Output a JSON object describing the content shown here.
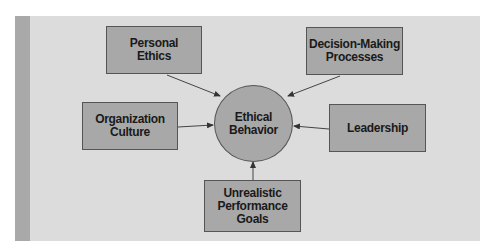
{
  "diagram": {
    "center": {
      "label": "Ethical\nBehavior"
    },
    "factors": [
      {
        "id": "personal-ethics",
        "label": "Personal\nEthics"
      },
      {
        "id": "decision-making-processes",
        "label": "Decision-Making\nProcesses"
      },
      {
        "id": "organization-culture",
        "label": "Organization\nCulture"
      },
      {
        "id": "leadership",
        "label": "Leadership"
      },
      {
        "id": "unrealistic-performance-goals",
        "label": "Unrealistic\nPerformance\nGoals"
      }
    ],
    "colors": {
      "panel": "#dcdcdc",
      "stripe": "#a9a9a9",
      "node_fill": "#a8a8a8",
      "node_border": "#555555",
      "text": "#1a1a1a"
    }
  }
}
